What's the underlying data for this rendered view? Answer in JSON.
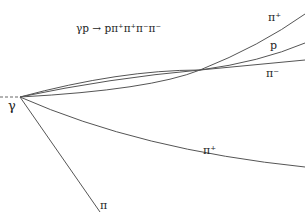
{
  "reaction": {
    "lhs": "γp",
    "arrow": "→",
    "rhs": "pπ⁺π⁺π⁻π⁻"
  },
  "vertex_label": "γ",
  "tracks": [
    {
      "label": "π⁺",
      "description": "upper-right curving track"
    },
    {
      "label": "p",
      "description": "middle-right track"
    },
    {
      "label": "π⁻",
      "description": "lower of upper trio"
    },
    {
      "label": "π⁺",
      "description": "long lower curving track"
    },
    {
      "label": "π",
      "description": "steep downward track"
    }
  ],
  "colors": {
    "line": "#555555",
    "background": "#ffffff"
  }
}
